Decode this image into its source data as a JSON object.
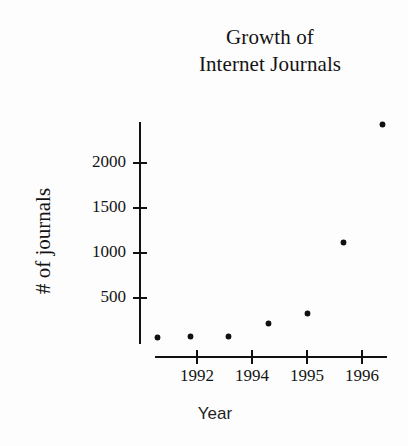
{
  "background_color": "#fdfdfd",
  "ink_color": "#111111",
  "title": {
    "line1": "Growth of",
    "line2": "Internet Journals"
  },
  "axes": {
    "x_label": "Year",
    "y_label": "# of journals"
  },
  "chart_data": {
    "type": "scatter",
    "title": "Growth of Internet Journals",
    "xlabel": "Year",
    "ylabel": "# of journals",
    "xlim": [
      1990.6,
      1996.8
    ],
    "ylim": [
      0,
      2600
    ],
    "grid": false,
    "legend": false,
    "x_tick_labels": [
      "1992",
      "1994",
      "1995",
      "1996"
    ],
    "x_tick_values": [
      1992,
      1994,
      1995,
      1996
    ],
    "y_tick_labels": [
      "500",
      "1000",
      "1500",
      "2000"
    ],
    "y_tick_values": [
      500,
      1000,
      1500,
      2000
    ],
    "marker": "diamond",
    "marker_color": "#111111",
    "x": [
      1991.0,
      1991.9,
      1992.9,
      1993.9,
      1994.9,
      1995.6,
      1996.5
    ],
    "values": [
      60,
      75,
      80,
      220,
      330,
      1100,
      2430
    ],
    "points": [
      {
        "x": 1991.0,
        "y": 60
      },
      {
        "x": 1991.9,
        "y": 75
      },
      {
        "x": 1992.9,
        "y": 80
      },
      {
        "x": 1993.9,
        "y": 220
      },
      {
        "x": 1994.9,
        "y": 330
      },
      {
        "x": 1995.6,
        "y": 1100
      },
      {
        "x": 1996.5,
        "y": 2430
      }
    ]
  },
  "geometry": {
    "x_tick_px": [
      197,
      252,
      307,
      362
    ],
    "y_tick_px": [
      298,
      253,
      208,
      163
    ],
    "point_px": [
      {
        "left": 157,
        "top": 337
      },
      {
        "left": 190,
        "top": 336
      },
      {
        "left": 228,
        "top": 336
      },
      {
        "left": 268,
        "top": 323
      },
      {
        "left": 307,
        "top": 313
      },
      {
        "left": 343,
        "top": 242
      },
      {
        "left": 382,
        "top": 124
      }
    ]
  }
}
